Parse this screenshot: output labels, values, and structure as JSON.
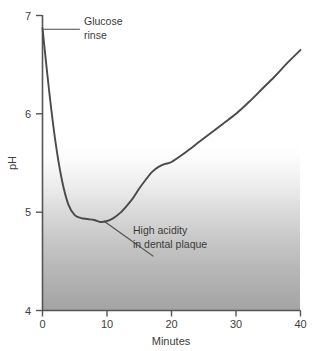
{
  "chart_data": {
    "type": "line",
    "title": "",
    "xlabel": "Minutes",
    "ylabel": "pH",
    "xlim": [
      0,
      40
    ],
    "ylim": [
      4,
      7
    ],
    "xticks": [
      0,
      10,
      20,
      30,
      40
    ],
    "yticks": [
      4,
      5,
      6,
      7
    ],
    "xtick_labels": [
      "0",
      "10",
      "20",
      "30",
      "40"
    ],
    "ytick_labels": [
      "4",
      "5",
      "6",
      "7"
    ],
    "grid": false,
    "legend": null,
    "series": [
      {
        "name": "Plaque pH after glucose rinse",
        "color": "#4a4a4a",
        "x": [
          0,
          1,
          2,
          3,
          4,
          5,
          6,
          7,
          8,
          9,
          10,
          11,
          12,
          13,
          14,
          15,
          16,
          17,
          18,
          19,
          20,
          22,
          24,
          26,
          28,
          30,
          32,
          34,
          36,
          38,
          40
        ],
        "y": [
          6.87,
          6.25,
          5.72,
          5.33,
          5.08,
          4.97,
          4.94,
          4.93,
          4.92,
          4.9,
          4.91,
          4.94,
          4.99,
          5.06,
          5.14,
          5.24,
          5.33,
          5.41,
          5.46,
          5.49,
          5.51,
          5.6,
          5.7,
          5.8,
          5.9,
          6.0,
          6.12,
          6.25,
          6.38,
          6.52,
          6.65
        ]
      }
    ],
    "annotations": [
      {
        "name": "glucose-rinse",
        "text_lines": [
          "Glucose",
          "rinse"
        ],
        "point": {
          "x": 0.2,
          "y": 6.86
        },
        "label_pos": {
          "x": 5.8,
          "y": 6.86
        }
      },
      {
        "name": "high-acidity",
        "text_lines": [
          "High acidity",
          "in dental plaque"
        ],
        "point": {
          "x": 9.5,
          "y": 4.91
        },
        "label_pos": {
          "x": 17.2,
          "y": 4.55
        }
      }
    ],
    "shading": {
      "description": "vertical gradient shading in plot area, light at top fading to gray at bottom",
      "top_color": "#ffffff",
      "bottom_color": "#a6a6a6"
    },
    "axis_color": "#555555",
    "line_color": "#4a4a4a"
  }
}
